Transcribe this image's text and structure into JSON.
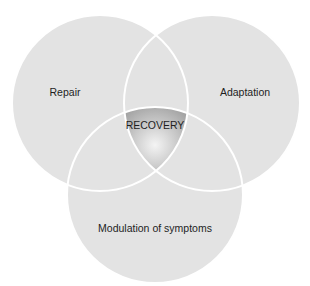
{
  "diagram": {
    "type": "venn",
    "circles": [
      {
        "id": "repair",
        "label": "Repair"
      },
      {
        "id": "adaptation",
        "label": "Adaptation"
      },
      {
        "id": "modulation",
        "label": "Modulation of symptoms"
      }
    ],
    "intersection": {
      "label": "RECOVERY"
    },
    "colors": {
      "circle_fill": "#e3e3e3",
      "stroke": "#ffffff",
      "center_light": "#f4f4f4",
      "center_dark": "#a9a9a9",
      "text": "#1e1e1e"
    }
  }
}
